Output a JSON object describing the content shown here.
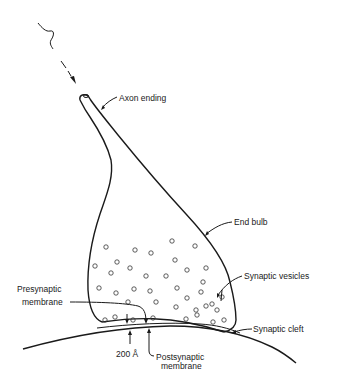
{
  "diagram": {
    "labels": {
      "axon_ending": "Axon ending",
      "end_bulb": "End bulb",
      "synaptic_vesicles": "Synaptic vesicles",
      "presynaptic_line1": "Presynaptic",
      "presynaptic_line2": "membrane",
      "synaptic_cleft": "Synaptic cleft",
      "cleft_width": "200 Å",
      "postsynaptic_line1": "Postsynaptic",
      "postsynaptic_line2": "membrane"
    },
    "signal_arrow": "nerve-impulse-arrow",
    "colors": {
      "ink": "#1a1a1a",
      "background": "#ffffff"
    }
  }
}
